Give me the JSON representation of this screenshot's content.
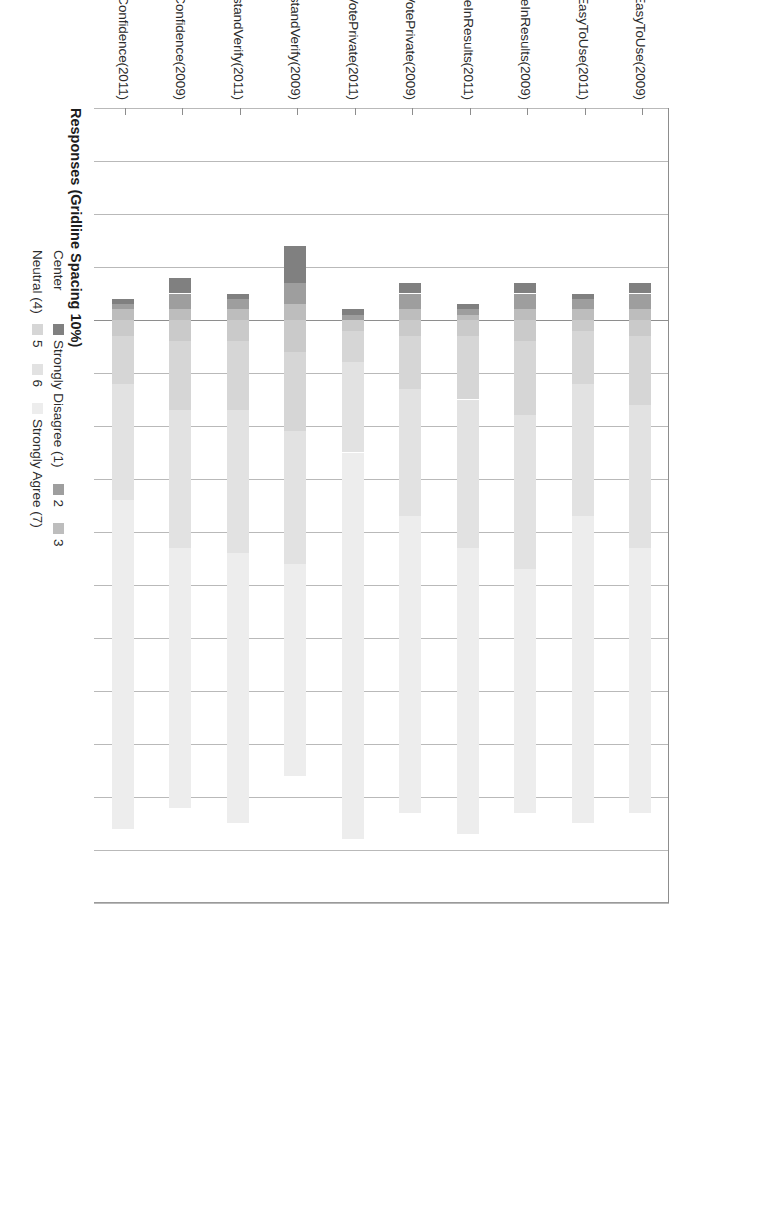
{
  "chart": {
    "type": "bar",
    "axis_title": "Responses (Gridline Spacing 10%)",
    "gridline_spacing_label": "10%"
  },
  "legend": {
    "row1_lead": "Center",
    "row2_lead": "Neutral (4)",
    "items_row1": [
      {
        "label": "Strongly Disagree (1)",
        "color": "#808080"
      },
      {
        "label": "2",
        "color": "#9e9e9e"
      },
      {
        "label": "3",
        "color": "#bdbdbd"
      }
    ],
    "items_row2": [
      {
        "label": "5",
        "color": "#d6d6d6"
      },
      {
        "label": "6",
        "color": "#e2e2e2"
      },
      {
        "label": "Strongly Agree (7)",
        "color": "#ededed"
      }
    ]
  },
  "chart_data": {
    "type": "bar",
    "subtype": "diverging-stacked-likert",
    "title": "",
    "xlabel": "Responses (Gridline Spacing 10%)",
    "ylabel": "",
    "grid": true,
    "gridline_spacing_pct": 10,
    "legend_position": "bottom",
    "orientation": "horizontal-rotated-90",
    "axis_range_pct": [
      -40,
      110
    ],
    "center_label": "Center",
    "neutral_label": "Neutral (4)",
    "series": [
      {
        "name": "Strongly Disagree (1)",
        "color": "#808080"
      },
      {
        "name": "2",
        "color": "#9e9e9e"
      },
      {
        "name": "3",
        "color": "#bdbdbd"
      },
      {
        "name": "Neutral (4)",
        "color": "#cacaca"
      },
      {
        "name": "5",
        "color": "#d6d6d6"
      },
      {
        "name": "6",
        "color": "#e2e2e2"
      },
      {
        "name": "Strongly Agree (7)",
        "color": "#ededed"
      }
    ],
    "categories": [
      "EasyToUse(2009)",
      "EasyToUse(2011)",
      "ConfidenceInResults(2009)",
      "ConfidenceInResults(2011)",
      "ConfidenceVotePrivate(2009)",
      "ConfidenceVotePrivate(2011)",
      "UnderstandVerify(2009)",
      "UnderstandVerify(2011)",
      "VerifIncreasesConfidence(2009)",
      "VerifIncreasesConfidence(2011)"
    ],
    "bars": [
      {
        "category": "EasyToUse(2009)",
        "neg_start_pct": -7,
        "values": {
          "1": 2,
          "2": 3,
          "3": 2,
          "4": 3,
          "5": 13,
          "6": 27,
          "7": 50
        }
      },
      {
        "category": "EasyToUse(2011)",
        "neg_start_pct": -5,
        "values": {
          "1": 1,
          "2": 2,
          "3": 2,
          "4": 2,
          "5": 10,
          "6": 25,
          "7": 58
        }
      },
      {
        "category": "ConfidenceInResults(2009)",
        "neg_start_pct": -7,
        "values": {
          "1": 2,
          "2": 3,
          "3": 2,
          "4": 4,
          "5": 14,
          "6": 29,
          "7": 46
        }
      },
      {
        "category": "ConfidenceInResults(2011)",
        "neg_start_pct": -3,
        "values": {
          "1": 1,
          "2": 1,
          "3": 1,
          "4": 3,
          "5": 12,
          "6": 28,
          "7": 54
        }
      },
      {
        "category": "ConfidenceVotePrivate(2009)",
        "neg_start_pct": -7,
        "values": {
          "1": 2,
          "2": 3,
          "3": 2,
          "4": 3,
          "5": 10,
          "6": 24,
          "7": 56
        }
      },
      {
        "category": "ConfidenceVotePrivate(2011)",
        "neg_start_pct": -2,
        "values": {
          "1": 1,
          "2": 1,
          "3": 0,
          "4": 2,
          "5": 6,
          "6": 17,
          "7": 73
        }
      },
      {
        "category": "UnderstandVerify(2009)",
        "neg_start_pct": -14,
        "values": {
          "1": 7,
          "2": 4,
          "3": 3,
          "4": 6,
          "5": 15,
          "6": 25,
          "7": 40
        }
      },
      {
        "category": "UnderstandVerify(2011)",
        "neg_start_pct": -5,
        "values": {
          "1": 1,
          "2": 2,
          "3": 2,
          "4": 4,
          "5": 13,
          "6": 27,
          "7": 51
        }
      },
      {
        "category": "VerifIncreasesConfidence(2009)",
        "neg_start_pct": -8,
        "values": {
          "1": 3,
          "2": 3,
          "3": 2,
          "4": 4,
          "5": 13,
          "6": 26,
          "7": 49
        }
      },
      {
        "category": "VerifIncreasesConfidence(2011)",
        "neg_start_pct": -4,
        "values": {
          "1": 1,
          "2": 1,
          "3": 2,
          "4": 3,
          "5": 9,
          "6": 22,
          "7": 62
        }
      }
    ]
  }
}
